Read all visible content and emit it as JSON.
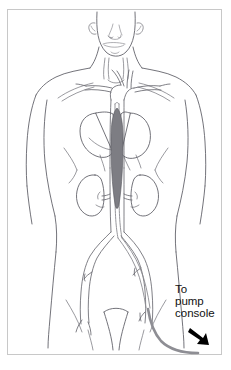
{
  "figure": {
    "border_color": "#c8c8c8",
    "background_color": "#ffffff"
  },
  "callout": {
    "line1": "To",
    "line2": "pump",
    "line3": "console",
    "text_color": "#111111",
    "arrow_icon": "arrow-down-right-icon",
    "arrow_color": "#000000"
  },
  "anatomy": {
    "body_outline": {
      "name": "human-torso-outline",
      "stroke_color": "#5a5a62"
    },
    "head": {
      "name": "head-and-face",
      "features": [
        "nose",
        "mouth",
        "chin",
        "left-ear",
        "right-ear"
      ]
    },
    "heart": {
      "name": "heart",
      "stroke_color": "#5a5a62",
      "fill_color": "#ffffff"
    },
    "aorta": {
      "name": "aorta",
      "segments": [
        "aortic-arch",
        "descending-thoracic-aorta",
        "abdominal-aorta"
      ],
      "stroke_color": "#5f5f67"
    },
    "arch_branches": {
      "name": "aortic-arch-branches",
      "vessels": [
        "brachiocephalic-artery",
        "left-common-carotid-artery",
        "left-subclavian-artery"
      ]
    },
    "kidney_left": {
      "name": "left-kidney",
      "fill_color": "#ffffff"
    },
    "kidney_right": {
      "name": "right-kidney",
      "fill_color": "#ffffff"
    },
    "renal_arteries": {
      "name": "renal-arteries"
    },
    "iliac_arteries": {
      "name": "iliac-arteries",
      "branches": [
        "left-common-iliac",
        "right-common-iliac",
        "femoral-artery"
      ]
    },
    "balloon": {
      "name": "intra-aortic-balloon",
      "fill_color": "#7d7d83",
      "stroke_color": "#55555c",
      "position": "descending-thoracic-aorta"
    },
    "catheter": {
      "name": "balloon-catheter",
      "stroke_color": "#8a8a90",
      "route": "femoral-artery-to-descending-aorta"
    }
  }
}
